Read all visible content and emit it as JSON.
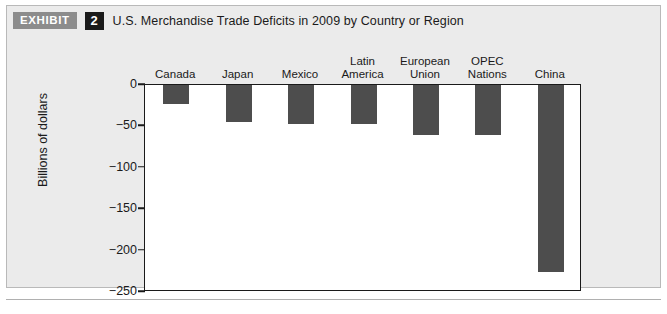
{
  "header": {
    "exhibit_label": "EXHIBIT",
    "exhibit_number": "2",
    "title": "U.S. Merchandise Trade Deficits in 2009 by Country or Region"
  },
  "colors": {
    "bar": "#4d4d4d",
    "panel_background": "#ebebeb",
    "plot_background": "#ffffff",
    "axis": "#1a1a1a",
    "exhibit_badge": "#8c8c8c",
    "number_badge": "#1a1a1a"
  },
  "chart_data": {
    "type": "bar",
    "title": "U.S. Merchandise Trade Deficits in 2009 by Country or Region",
    "xlabel": "",
    "ylabel": "Billions of dollars",
    "categories": [
      "Canada",
      "Japan",
      "Mexico",
      "Latin America",
      "European Union",
      "OPEC Nations",
      "China"
    ],
    "category_lines": [
      [
        "Canada"
      ],
      [
        "Japan"
      ],
      [
        "Mexico"
      ],
      [
        "Latin",
        "America"
      ],
      [
        "European",
        "Union"
      ],
      [
        "OPEC",
        "Nations"
      ],
      [
        "China"
      ]
    ],
    "values": [
      -23,
      -45,
      -47,
      -47,
      -60,
      -60,
      -226
    ],
    "ylim": [
      -250,
      0
    ],
    "yticks": [
      0,
      -50,
      -100,
      -150,
      -200,
      -250
    ],
    "ytick_labels": [
      "0",
      "−50",
      "−100",
      "−150",
      "−200",
      "−250"
    ],
    "grid": false,
    "legend": false,
    "category_labels_position": "top",
    "bars_direction": "downward"
  }
}
